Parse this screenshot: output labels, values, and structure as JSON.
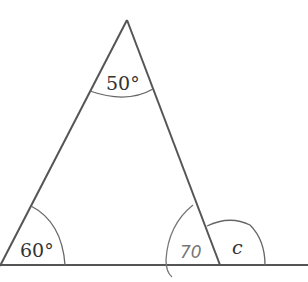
{
  "diagram": {
    "type": "triangle-with-exterior-angle",
    "angles": {
      "apex": "50°",
      "bottom_left": "60°",
      "bottom_right_interior": "70",
      "exterior": "c"
    },
    "colors": {
      "line": "#555555",
      "arc": "#666666",
      "handwriting": "#777777"
    }
  }
}
